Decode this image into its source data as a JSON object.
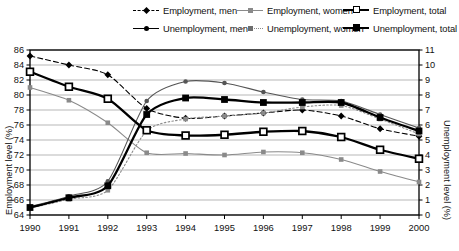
{
  "chart_data": {
    "type": "line",
    "title": "",
    "xlabel": "",
    "ylabel": "Employment level (%)",
    "ylabel_right": "Unemployment level (%)",
    "x": [
      1990,
      1991,
      1992,
      1993,
      1994,
      1995,
      1996,
      1997,
      1998,
      1999,
      2000
    ],
    "xticklabels": [
      "1990",
      "1991",
      "1992",
      "1993",
      "1994",
      "1995",
      "1996",
      "1997",
      "1998",
      "1999",
      "2000"
    ],
    "ylim": [
      64,
      86
    ],
    "yticks": [
      64,
      66,
      68,
      70,
      72,
      74,
      76,
      78,
      80,
      82,
      84,
      86
    ],
    "ylim_right": [
      0,
      11
    ],
    "yticks_right": [
      0,
      1,
      2,
      3,
      4,
      5,
      6,
      7,
      8,
      9,
      10,
      11
    ],
    "grid": true,
    "legend_position": "top",
    "series": [
      {
        "name": "Employment, men",
        "axis": "left",
        "marker": "diamond",
        "line": "dashed",
        "color": "#000000",
        "values": [
          85.2,
          84.0,
          82.7,
          78.2,
          76.9,
          77.2,
          77.6,
          78.0,
          77.2,
          75.5,
          74.5
        ]
      },
      {
        "name": "Employment, women",
        "axis": "left",
        "marker": "square-small",
        "line": "solid",
        "color": "#8a8a8a",
        "values": [
          81.0,
          79.3,
          76.3,
          72.3,
          72.2,
          72.0,
          72.4,
          72.3,
          71.4,
          69.8,
          68.4
        ]
      },
      {
        "name": "Employment, total",
        "axis": "left",
        "marker": "square-open",
        "line": "solid",
        "color": "#000000",
        "values": [
          83.1,
          81.1,
          79.5,
          75.3,
          74.6,
          74.7,
          75.1,
          75.2,
          74.4,
          72.7,
          71.5
        ]
      },
      {
        "name": "Unemployment, men",
        "axis": "right",
        "marker": "dot",
        "line": "solid",
        "color": "#555555",
        "values": [
          0.55,
          1.25,
          2.25,
          7.6,
          8.9,
          8.8,
          8.2,
          7.7,
          7.6,
          6.7,
          5.8
        ]
      },
      {
        "name": "Unemployment, women",
        "axis": "right",
        "marker": "square-small",
        "line": "dotted",
        "color": "#8a8a8a",
        "values": [
          0.45,
          1.05,
          1.65,
          5.6,
          6.4,
          6.6,
          6.8,
          7.2,
          7.3,
          6.4,
          5.4
        ]
      },
      {
        "name": "Unemployment, total",
        "axis": "right",
        "marker": "square-filled",
        "line": "solid",
        "color": "#000000",
        "values": [
          0.5,
          1.15,
          1.95,
          6.7,
          7.8,
          7.7,
          7.5,
          7.5,
          7.5,
          6.5,
          5.6
        ]
      }
    ]
  },
  "legend": {
    "items": [
      {
        "label": "Employment, men"
      },
      {
        "label": "Employment, women"
      },
      {
        "label": "Employment, total"
      },
      {
        "label": "Unemployment, men"
      },
      {
        "label": "Unemployment, women"
      },
      {
        "label": "Unemployment, total"
      }
    ]
  },
  "axes": {
    "left_title": "Employment level (%)",
    "right_title": "Unemployment level (%)"
  }
}
